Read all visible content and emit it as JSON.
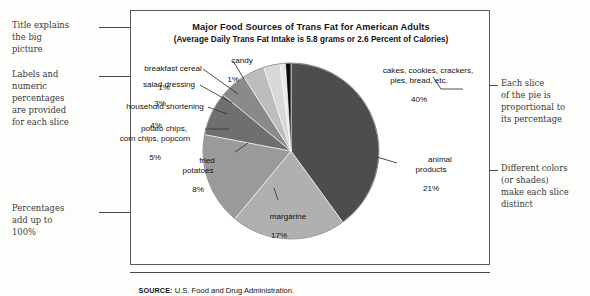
{
  "figure": {
    "title": "Major Food Sources of Trans Fat for American Adults",
    "subtitle": "(Average Daily Trans Fat Intake is 5.8 grams or 2.6 Percent of Calories)",
    "source_prefix": "SOURCE:",
    "source_text": " U.S. Food and Drug Administration."
  },
  "chart_data": {
    "type": "pie",
    "title": "Major Food Sources of Trans Fat for American Adults",
    "subtitle": "(Average Daily Trans Fat Intake is 5.8 grams or 2.6 Percent of Calories)",
    "xlabel": "",
    "ylabel": "",
    "legend_position": "none",
    "grid": false,
    "units": "percent",
    "total": 100,
    "categories": [
      "cakes, cookies, crackers, pies, bread, etc.",
      "animal products",
      "margarine",
      "fried potatoes",
      "potato chips, corn chips, popcorn",
      "household shortening",
      "salad dressing",
      "breakfast cereal",
      "candy"
    ],
    "values": [
      40,
      21,
      17,
      8,
      5,
      4,
      3,
      1,
      1
    ],
    "colors": [
      "#4d4d4d",
      "#b0b0b0",
      "#9a9a9a",
      "#6f6f6f",
      "#8a8a8a",
      "#bdbdbd",
      "#d8d8d8",
      "#e8e8e8",
      "#0d0d0d"
    ],
    "slices": [
      {
        "label": "cakes, cookies, crackers,\npies, bread, etc.",
        "percent_label": "40%",
        "value": 40,
        "color": "#4d4d4d"
      },
      {
        "label": "animal\nproducts",
        "percent_label": "21%",
        "value": 21,
        "color": "#b0b0b0"
      },
      {
        "label": "margarine",
        "percent_label": "17%",
        "value": 17,
        "color": "#9a9a9a"
      },
      {
        "label": "fried\npotatoes",
        "percent_label": "8%",
        "value": 8,
        "color": "#6f6f6f"
      },
      {
        "label": "potato chips,\ncorn chips, popcorn",
        "percent_label": "5%",
        "value": 5,
        "color": "#8a8a8a"
      },
      {
        "label": "household shortening",
        "percent_label": "4%",
        "value": 4,
        "color": "#bdbdbd"
      },
      {
        "label": "salad dressing",
        "percent_label": "3%",
        "value": 3,
        "color": "#d8d8d8"
      },
      {
        "label": "breakfast cereal",
        "percent_label": "1%",
        "value": 1,
        "color": "#e8e8e8"
      },
      {
        "label": "candy",
        "percent_label": "1%",
        "value": 1,
        "color": "#0d0d0d"
      }
    ]
  },
  "annotations": {
    "left": [
      {
        "text": "Title explains\nthe big\npicture"
      },
      {
        "text": "Labels and\nnumeric\npercentages\nare provided\nfor each slice"
      },
      {
        "text": "Percentages\nadd up to\n100%"
      }
    ],
    "right": [
      {
        "text": "Each slice\nof the pie is\nproportional to\nits percentage"
      },
      {
        "text": "Different colors\n(or shades)\nmake each slice\ndistinct"
      }
    ]
  }
}
